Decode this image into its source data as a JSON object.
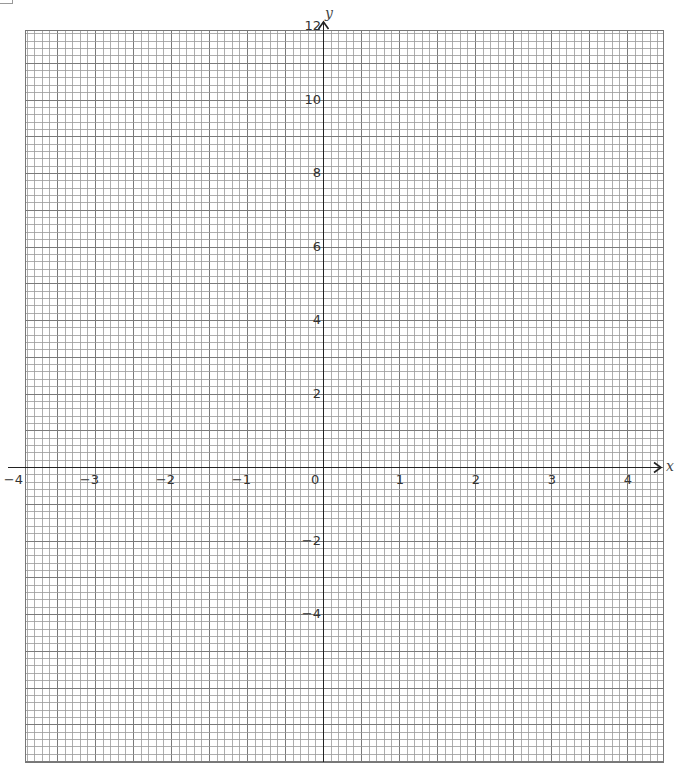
{
  "chart_data": {
    "type": "line",
    "title": "",
    "xlabel": "x",
    "ylabel": "y",
    "xlim": [
      -3.92,
      4.47
    ],
    "ylim": [
      -8.0,
      12
    ],
    "grid": true,
    "grid_minor_x_step": 0.1,
    "grid_minor_y_step": 0.2,
    "x_ticks": [
      {
        "value": -4,
        "label": "−4"
      },
      {
        "value": -3,
        "label": "−3"
      },
      {
        "value": -2,
        "label": "−2"
      },
      {
        "value": -1,
        "label": "−1"
      },
      {
        "value": 0,
        "label": "0"
      },
      {
        "value": 1,
        "label": "1"
      },
      {
        "value": 2,
        "label": "2"
      },
      {
        "value": 3,
        "label": "3"
      },
      {
        "value": 4,
        "label": "4"
      }
    ],
    "y_ticks": [
      {
        "value": 12,
        "label": "12"
      },
      {
        "value": 10,
        "label": "10"
      },
      {
        "value": 8,
        "label": "8"
      },
      {
        "value": 6,
        "label": "6"
      },
      {
        "value": 4,
        "label": "4"
      },
      {
        "value": 2,
        "label": "2"
      },
      {
        "value": -2,
        "label": "−2"
      },
      {
        "value": -4,
        "label": "−4"
      }
    ],
    "series": [],
    "legend": null
  },
  "layout": {
    "grid_left": 25,
    "grid_top": 30,
    "grid_right": 663,
    "grid_bottom": 762,
    "origin_x": 323,
    "origin_y": 467,
    "px_per_x_unit": 76,
    "px_per_y_unit": 36.75,
    "colors": {
      "grid_line": "#9a9a9a",
      "axis_line": "#222222",
      "label": "#333333"
    }
  }
}
